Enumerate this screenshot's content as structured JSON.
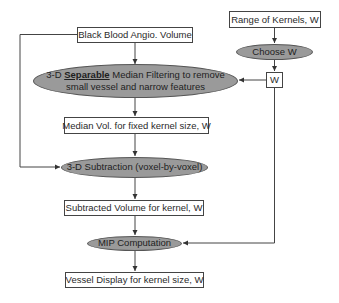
{
  "diagram": {
    "nodes": {
      "input_volume": {
        "label": "Black Blood Angio. Volume",
        "shape": "rectangle"
      },
      "median_filter": {
        "line1_prefix": "3-D ",
        "line1_emphasis": "Separable",
        "line1_suffix": " Median Filtering to remove",
        "line2": "small vessel and narrow features",
        "shape": "ellipse"
      },
      "median_volume": {
        "label": "Median Vol. for fixed kernel size, W",
        "shape": "rectangle"
      },
      "subtraction": {
        "label": "3-D Subtraction (voxel-by-voxel)",
        "shape": "ellipse"
      },
      "subtracted_volume": {
        "label": "Subtracted Volume for kernel, W",
        "shape": "rectangle"
      },
      "mip": {
        "label": "MIP Computation",
        "shape": "ellipse"
      },
      "vessel_display": {
        "label": "Vessel Display for kernel size, W",
        "shape": "rectangle"
      },
      "kernel_range": {
        "label": "Range of Kernels, W",
        "shape": "rectangle"
      },
      "choose_w": {
        "label": "Choose W",
        "shape": "ellipse"
      },
      "w_value": {
        "label": "W",
        "shape": "rectangle"
      }
    },
    "edges": [
      {
        "from": "input_volume",
        "to": "median_filter"
      },
      {
        "from": "median_filter",
        "to": "median_volume"
      },
      {
        "from": "median_volume",
        "to": "subtraction"
      },
      {
        "from": "input_volume",
        "to": "subtraction",
        "route": "left bypass"
      },
      {
        "from": "subtraction",
        "to": "subtracted_volume"
      },
      {
        "from": "subtracted_volume",
        "to": "mip"
      },
      {
        "from": "mip",
        "to": "vessel_display"
      },
      {
        "from": "kernel_range",
        "to": "choose_w"
      },
      {
        "from": "choose_w",
        "to": "w_value"
      },
      {
        "from": "w_value",
        "to": "median_filter"
      },
      {
        "from": "w_value",
        "to": "mip",
        "route": "right side"
      }
    ],
    "colors": {
      "ellipse_fill": "#9a9a9a",
      "stroke": "#444444",
      "box_fill": "#ffffff"
    }
  }
}
